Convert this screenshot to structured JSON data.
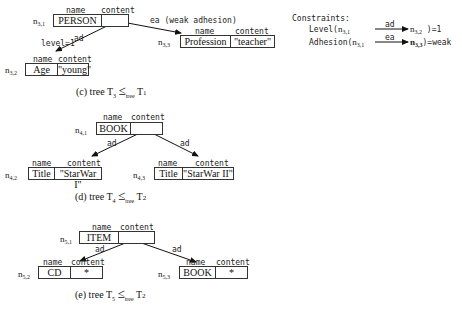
{
  "figure": {
    "header_labels": {
      "name": "name",
      "content": "content"
    },
    "trees": [
      {
        "id": "T3",
        "caption": {
          "prefix": "(c) tree T",
          "sub": "3",
          "rel": "≤",
          "rel_sub": "tree",
          "target": "T",
          "target_sub": "1"
        },
        "nodes": [
          {
            "label": "n",
            "sub": "3,1",
            "name": "PERSON",
            "content": ""
          },
          {
            "label": "n",
            "sub": "3,2",
            "name": "Age",
            "content": "\"young\""
          },
          {
            "label": "n",
            "sub": "3,3",
            "name": "Profession",
            "content": "\"teacher\""
          }
        ],
        "edges": [
          {
            "from": "n3,1",
            "to": "n3,2",
            "label": "ad",
            "extra": "level=1"
          },
          {
            "from": "n3,1",
            "to": "n3,3",
            "label": "ea (weak adhesion)"
          }
        ]
      },
      {
        "id": "T4",
        "caption": {
          "prefix": "(d) tree T",
          "sub": "4",
          "rel": "≤",
          "rel_sub": "tree",
          "target": "T",
          "target_sub": "2"
        },
        "nodes": [
          {
            "label": "n",
            "sub": "4,1",
            "name": "BOOK",
            "content": ""
          },
          {
            "label": "n",
            "sub": "4,2",
            "name": "Title",
            "content": "\"StarWar I\""
          },
          {
            "label": "n",
            "sub": "4,3",
            "name": "Title",
            "content": "\"StarWar II\""
          }
        ],
        "edges": [
          {
            "from": "n4,1",
            "to": "n4,2",
            "label": "ad"
          },
          {
            "from": "n4,1",
            "to": "n4,3",
            "label": "ad"
          }
        ]
      },
      {
        "id": "T5",
        "caption": {
          "prefix": "(e) tree T",
          "sub": "5",
          "rel": "≤",
          "rel_sub": "tree",
          "target": "T",
          "target_sub": "2"
        },
        "nodes": [
          {
            "label": "n",
            "sub": "5,1",
            "name": "ITEM",
            "content": ""
          },
          {
            "label": "n",
            "sub": "5,2",
            "name": "CD",
            "content": "*"
          },
          {
            "label": "n",
            "sub": "5,3",
            "name": "BOOK",
            "content": "*"
          }
        ],
        "edges": [
          {
            "from": "n5,1",
            "to": "n5,2",
            "label": "ad"
          },
          {
            "from": "n5,1",
            "to": "n5,3",
            "label": "ad"
          }
        ]
      }
    ],
    "constraints": {
      "title": "Constraints:",
      "lines": [
        {
          "fn": "Level(",
          "from": "n",
          "from_sub": "3,1",
          "arrow": "ad",
          "to": "n",
          "to_sub": "3,2",
          "result": ")=1"
        },
        {
          "fn": "Adhesion(",
          "from": "n",
          "from_sub": "3,1",
          "arrow": "ea",
          "to": "n",
          "to_sub": "3,3",
          "result": ")=weak"
        }
      ]
    }
  }
}
